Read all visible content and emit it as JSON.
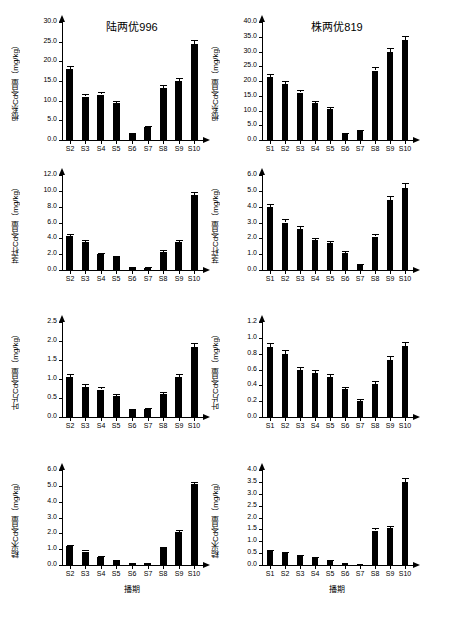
{
  "figure": {
    "column_titles": [
      "陆两优996",
      "株两优819"
    ],
    "xaxis_title": "播期"
  },
  "chart_data": [
    {
      "type": "bar",
      "id": "panel-r1c1",
      "title": "陆两优996",
      "ylabel": "根系Cd含量（mg/kg）",
      "xlabel": "",
      "categories": [
        "S2",
        "S3",
        "S4",
        "S5",
        "S6",
        "S7",
        "S8",
        "S9",
        "S10"
      ],
      "values": [
        18.0,
        11.0,
        11.5,
        9.3,
        1.6,
        3.3,
        13.3,
        15.0,
        24.5
      ],
      "errors": [
        0.9,
        0.6,
        0.6,
        0.5,
        0.2,
        0.3,
        0.7,
        0.8,
        1.0
      ],
      "ylim": [
        0.0,
        30.0
      ],
      "yticks": [
        "0.0",
        "5.0",
        "10.0",
        "15.0",
        "20.0",
        "25.0",
        "30.0"
      ],
      "grid": false
    },
    {
      "type": "bar",
      "id": "panel-r1c2",
      "title": "株两优819",
      "ylabel": "根系Cd含量（mg/kg）",
      "xlabel": "",
      "categories": [
        "S1",
        "S2",
        "S3",
        "S4",
        "S5",
        "S6",
        "S7",
        "S8",
        "S9",
        "S10"
      ],
      "values": [
        21.5,
        19.0,
        16.0,
        12.5,
        10.5,
        2.0,
        3.0,
        23.5,
        30.0,
        34.0
      ],
      "errors": [
        1.0,
        0.9,
        0.8,
        0.7,
        0.6,
        0.3,
        0.3,
        1.1,
        1.3,
        1.4
      ],
      "ylim": [
        0.0,
        40.0
      ],
      "yticks": [
        "0.0",
        "5.0",
        "10.0",
        "15.0",
        "20.0",
        "25.0",
        "30.0",
        "35.0",
        "40.0"
      ],
      "grid": false
    },
    {
      "type": "bar",
      "id": "panel-r2c1",
      "title": "",
      "ylabel": "茎杆Cd含量（mg/kg）",
      "xlabel": "",
      "categories": [
        "S2",
        "S3",
        "S4",
        "S5",
        "S6",
        "S7",
        "S8",
        "S9",
        "S10"
      ],
      "values": [
        4.3,
        3.5,
        2.0,
        1.6,
        0.3,
        0.3,
        2.3,
        3.5,
        9.5
      ],
      "errors": [
        0.3,
        0.25,
        0.2,
        0.15,
        0.08,
        0.08,
        0.2,
        0.25,
        0.4
      ],
      "ylim": [
        0.0,
        12.0
      ],
      "yticks": [
        "0.0",
        "2.0",
        "4.0",
        "6.0",
        "8.0",
        "10.0",
        "12.0"
      ],
      "grid": false
    },
    {
      "type": "bar",
      "id": "panel-r2c2",
      "title": "",
      "ylabel": "茎杆Cd含量（mg/kg）",
      "xlabel": "",
      "categories": [
        "S1",
        "S2",
        "S3",
        "S4",
        "S5",
        "S6",
        "S7",
        "S8",
        "S9",
        "S10"
      ],
      "values": [
        4.0,
        3.0,
        2.6,
        1.9,
        1.7,
        1.1,
        0.3,
        2.1,
        4.4,
        5.2
      ],
      "errors": [
        0.2,
        0.2,
        0.18,
        0.15,
        0.15,
        0.1,
        0.05,
        0.15,
        0.25,
        0.3
      ],
      "ylim": [
        0.0,
        6.0
      ],
      "yticks": [
        "0.0",
        "1.0",
        "2.0",
        "3.0",
        "4.0",
        "5.0",
        "6.0"
      ],
      "grid": false
    },
    {
      "type": "bar",
      "id": "panel-r3c1",
      "title": "",
      "ylabel": "叶片Cd含量（mg/kg）",
      "xlabel": "",
      "categories": [
        "S2",
        "S3",
        "S4",
        "S5",
        "S6",
        "S7",
        "S8",
        "S9",
        "S10"
      ],
      "values": [
        1.05,
        0.8,
        0.72,
        0.55,
        0.18,
        0.22,
        0.6,
        1.05,
        1.85
      ],
      "errors": [
        0.08,
        0.07,
        0.06,
        0.05,
        0.03,
        0.03,
        0.06,
        0.08,
        0.1
      ],
      "ylim": [
        0.0,
        2.5
      ],
      "yticks": [
        "0.0",
        "0.5",
        "1.0",
        "1.5",
        "2.0",
        "2.5"
      ],
      "grid": false
    },
    {
      "type": "bar",
      "id": "panel-r3c2",
      "title": "",
      "ylabel": "叶片Cd含量（mg/kg）",
      "xlabel": "",
      "categories": [
        "S1",
        "S2",
        "S3",
        "S4",
        "S5",
        "S6",
        "S7",
        "S8",
        "S9",
        "S10"
      ],
      "values": [
        0.88,
        0.8,
        0.59,
        0.55,
        0.5,
        0.35,
        0.2,
        0.42,
        0.72,
        0.9
      ],
      "errors": [
        0.05,
        0.05,
        0.04,
        0.04,
        0.04,
        0.03,
        0.03,
        0.04,
        0.05,
        0.05
      ],
      "ylim": [
        0.0,
        1.2
      ],
      "yticks": [
        "0.0",
        "0.2",
        "0.4",
        "0.6",
        "0.8",
        "1.0",
        "1.2"
      ],
      "grid": false
    },
    {
      "type": "bar",
      "id": "panel-r4c1",
      "title": "",
      "ylabel": "糙米Cd含量（mg/kg）",
      "xlabel": "播期",
      "categories": [
        "S2",
        "S3",
        "S4",
        "S5",
        "S6",
        "S7",
        "S8",
        "S9",
        "S10"
      ],
      "values": [
        1.2,
        0.85,
        0.52,
        0.3,
        0.12,
        0.1,
        1.05,
        2.1,
        5.1
      ],
      "errors": [
        0.08,
        0.07,
        0.05,
        0.04,
        0.03,
        0.03,
        0.08,
        0.12,
        0.15
      ],
      "ylim": [
        0.0,
        6.0
      ],
      "yticks": [
        "0.0",
        "1.0",
        "2.0",
        "3.0",
        "4.0",
        "5.0",
        "6.0"
      ],
      "grid": false
    },
    {
      "type": "bar",
      "id": "panel-r4c2",
      "title": "",
      "ylabel": "糙米Cd含量（mg/kg）",
      "xlabel": "播期",
      "categories": [
        "S1",
        "S2",
        "S3",
        "S4",
        "S5",
        "S6",
        "S7",
        "S8",
        "S9",
        "S10"
      ],
      "values": [
        0.6,
        0.52,
        0.38,
        0.3,
        0.18,
        0.1,
        0.06,
        1.45,
        1.55,
        3.5
      ],
      "errors": [
        0.05,
        0.04,
        0.04,
        0.03,
        0.03,
        0.02,
        0.02,
        0.1,
        0.1,
        0.15
      ],
      "ylim": [
        0.0,
        4.0
      ],
      "yticks": [
        "0.0",
        "0.5",
        "1.0",
        "1.5",
        "2.0",
        "2.5",
        "3.0",
        "3.5",
        "4.0"
      ],
      "grid": false
    }
  ]
}
